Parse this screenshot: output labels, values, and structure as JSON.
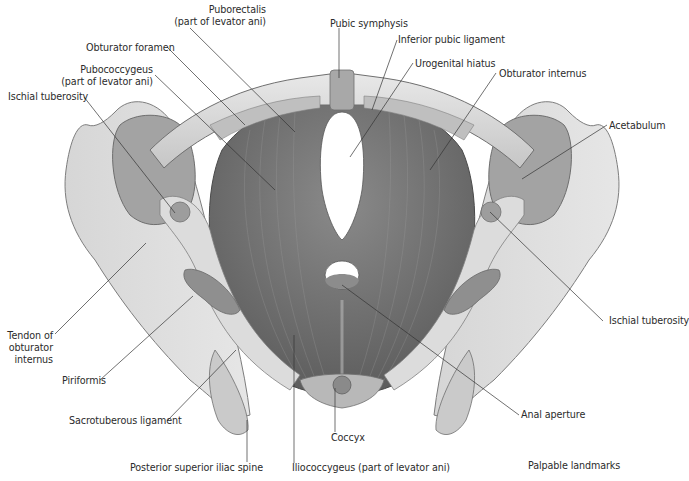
{
  "figure": {
    "title_fragment": "",
    "caption": "Palpable landmarks",
    "colors": {
      "background": "#ffffff",
      "bone_light": "#e4e4e4",
      "bone_mid": "#c8c8c8",
      "bone_shadow": "#9a9a9a",
      "muscle": "#7a7a7a",
      "muscle_dark": "#5e5e5e",
      "leader_line": "#333333",
      "label_text": "#2b2b2b"
    }
  },
  "labels": {
    "puborectalis": {
      "line1": "Puborectalis",
      "line2": "(part of levator ani)"
    },
    "pubic_symphysis": "Pubic symphysis",
    "inferior_pubic_ligament": "Inferior pubic ligament",
    "obturator_foramen": "Obturator foramen",
    "urogenital_hiatus": "Urogenital hiatus",
    "pubococcygeus": {
      "line1": "Pubococcygeus",
      "line2": "(part of levator ani)"
    },
    "obturator_internus": "Obturator internus",
    "ischial_tuberosity_left": "Ischial tuberosity",
    "acetabulum": "Acetabulum",
    "tendon_obturator_internus": {
      "line1": "Tendon of",
      "line2": "obturator",
      "line3": "internus"
    },
    "ischial_tuberosity_right": "Ischial tuberosity",
    "piriformis": "Piriformis",
    "sacrotuberous_ligament": "Sacrotuberous ligament",
    "anal_aperture": "Anal aperture",
    "coccyx": "Coccyx",
    "posterior_superior_iliac_spine": "Posterior superior iliac spine",
    "iliococcygeus": "Iliococcygeus (part of levator ani)",
    "palpable_landmarks": "Palpable landmarks"
  }
}
